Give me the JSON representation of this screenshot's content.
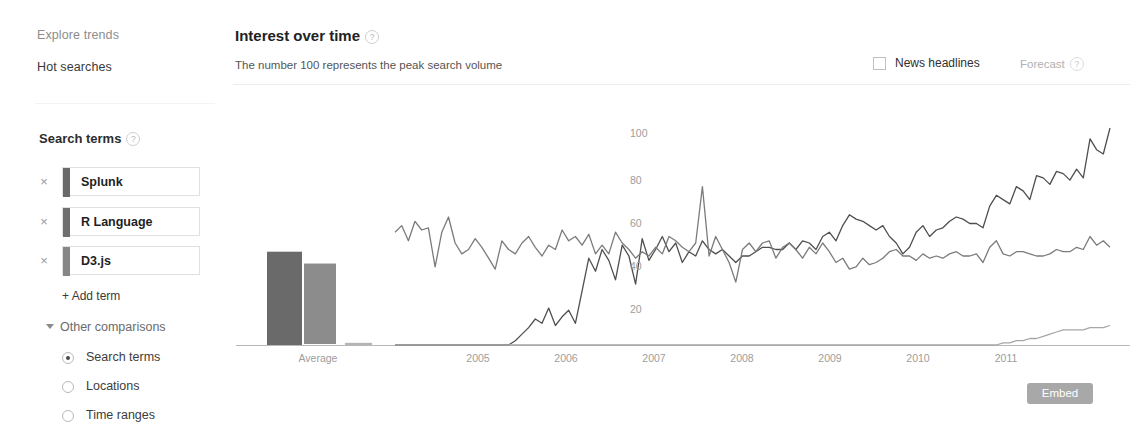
{
  "sidebar": {
    "nav": [
      {
        "label": "Explore trends",
        "name": "explore-trends"
      },
      {
        "label": "Hot searches",
        "name": "hot-searches"
      }
    ],
    "section_title": "Search terms",
    "help_glyph": "?",
    "terms": [
      {
        "label": "Splunk",
        "color": "#6a6a6a",
        "remove": "×"
      },
      {
        "label": "R Language",
        "color": "#6f6f6f",
        "remove": "×"
      },
      {
        "label": "D3.js",
        "color": "#868686",
        "remove": "×"
      }
    ],
    "add_term": "+ Add term",
    "other_comparisons": "Other comparisons",
    "radios": [
      {
        "label": "Search terms",
        "selected": true
      },
      {
        "label": "Locations",
        "selected": false
      },
      {
        "label": "Time ranges",
        "selected": false
      }
    ]
  },
  "header": {
    "title": "Interest over time",
    "subtitle": "The number 100 represents the peak search volume",
    "news_headlines": "News headlines",
    "news_checked": false,
    "forecast": "Forecast",
    "help_glyph": "?"
  },
  "footer": {
    "embed": "Embed"
  },
  "chart_data": {
    "type": "line",
    "title": "Interest over time",
    "subtitle": "The number 100 represents the peak search volume",
    "xlabel": "",
    "ylabel": "",
    "ylim": [
      0,
      105
    ],
    "yticks": [
      20,
      40,
      60,
      80,
      100
    ],
    "xticks": [
      "2005",
      "2006",
      "2007",
      "2008",
      "2009",
      "2010",
      "2011"
    ],
    "average_label": "Average",
    "grid": false,
    "legend": "none",
    "average_bars": [
      {
        "name": "Splunk",
        "value": 43,
        "style": "solid",
        "color": "#6a6a6a"
      },
      {
        "name": "R Language",
        "value": 38,
        "style": "outlined",
        "color": "#8c8c8c"
      },
      {
        "name": "D3.js",
        "value": 1,
        "style": "solid",
        "color": "#b5b5b5"
      }
    ],
    "x_start": "2004-01",
    "x_end": "2012-01",
    "series": [
      {
        "name": "Splunk",
        "color": "#4f4f4f",
        "values": [
          0,
          0,
          0,
          0,
          0,
          0,
          0,
          0,
          0,
          0,
          0,
          0,
          0,
          0,
          0,
          0,
          0,
          0,
          2,
          5,
          8,
          12,
          10,
          17,
          9,
          13,
          16,
          10,
          25,
          40,
          34,
          44,
          39,
          30,
          46,
          41,
          28,
          49,
          39,
          44,
          50,
          43,
          47,
          38,
          43,
          41,
          48,
          44,
          42,
          44,
          41,
          38,
          41,
          41,
          43,
          45,
          45,
          44,
          44,
          47,
          44,
          48,
          47,
          44,
          50,
          52,
          48,
          55,
          60,
          58,
          57,
          55,
          53,
          55,
          50,
          47,
          42,
          45,
          52,
          55,
          50,
          53,
          54,
          57,
          59,
          58,
          56,
          56,
          54,
          64,
          69,
          67,
          65,
          73,
          71,
          67,
          78,
          77,
          74,
          80,
          79,
          76,
          81,
          77,
          95,
          90,
          88,
          100
        ]
      },
      {
        "name": "R Language",
        "color": "#7b7b7b",
        "values": [
          52,
          55,
          48,
          57,
          53,
          54,
          36,
          52,
          59,
          47,
          42,
          44,
          49,
          45,
          40,
          35,
          48,
          44,
          42,
          47,
          50,
          45,
          41,
          46,
          44,
          53,
          48,
          50,
          46,
          51,
          42,
          46,
          42,
          52,
          47,
          44,
          40,
          43,
          41,
          45,
          42,
          50,
          48,
          45,
          43,
          47,
          73,
          41,
          50,
          44,
          38,
          29,
          44,
          47,
          43,
          47,
          48,
          40,
          45,
          47,
          44,
          40,
          45,
          42,
          47,
          43,
          38,
          40,
          35,
          36,
          40,
          37,
          38,
          40,
          43,
          44,
          41,
          41,
          39,
          42,
          40,
          41,
          40,
          42,
          43,
          41,
          41,
          42,
          38,
          45,
          48,
          42,
          41,
          43,
          43,
          42,
          41,
          41,
          42,
          44,
          43,
          43,
          45,
          44,
          50,
          46,
          48,
          45
        ]
      },
      {
        "name": "D3.js",
        "color": "#a6a6a6",
        "values": [
          0,
          0,
          0,
          0,
          0,
          0,
          0,
          0,
          0,
          0,
          0,
          0,
          0,
          0,
          0,
          0,
          0,
          0,
          0,
          0,
          0,
          0,
          0,
          0,
          0,
          0,
          0,
          0,
          0,
          0,
          0,
          0,
          0,
          0,
          0,
          0,
          0,
          0,
          0,
          0,
          0,
          0,
          0,
          0,
          0,
          0,
          0,
          0,
          0,
          0,
          0,
          0,
          0,
          0,
          0,
          0,
          0,
          0,
          0,
          0,
          0,
          0,
          0,
          0,
          0,
          0,
          0,
          0,
          0,
          0,
          0,
          0,
          0,
          0,
          0,
          0,
          0,
          0,
          0,
          0,
          0,
          0,
          0,
          0,
          0,
          0,
          0,
          0,
          0,
          0,
          0,
          1,
          1,
          2,
          2,
          3,
          3,
          4,
          5,
          6,
          7,
          7,
          7,
          7,
          8,
          8,
          8,
          9
        ]
      }
    ]
  }
}
